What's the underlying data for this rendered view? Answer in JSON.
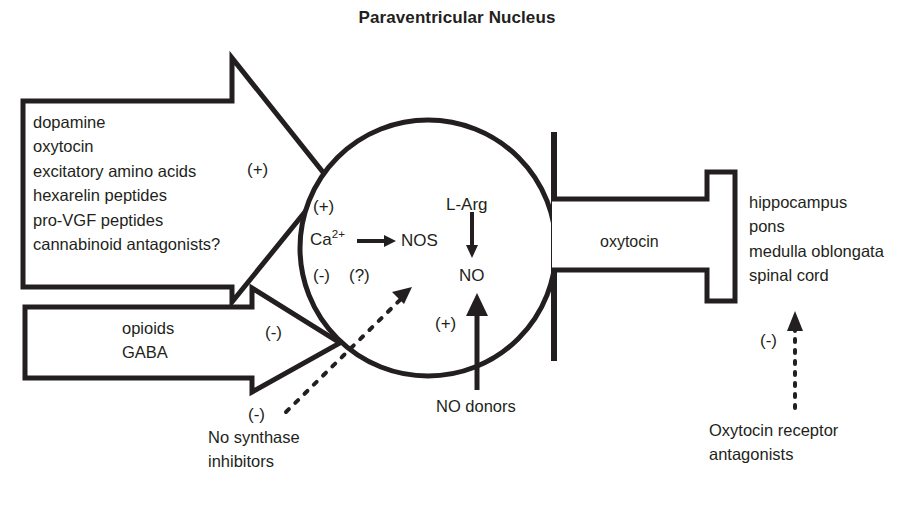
{
  "title": "Paraventricular Nucleus",
  "inputs": {
    "label": "excitatory-inputs",
    "sign": "(+)",
    "items_text": "dopamine\noxytocin\nexcitatory amino acids\nhexarelin peptides\npro-VGF peptides\ncannabinoid antagonists?",
    "items": [
      "dopamine",
      "oxytocin",
      "excitatory amino acids",
      "hexarelin peptides",
      "pro-VGF peptides",
      "cannabinoid antagonists?"
    ]
  },
  "inhibitors": {
    "sign": "(-)",
    "items_text": "opioids\nGABA",
    "items": [
      "opioids",
      "GABA"
    ]
  },
  "nucleus": {
    "sign_excitatory": "(+)",
    "sign_inhibitory": "(-)",
    "sign_unknown": "(?)",
    "calcium": "Ca",
    "calcium_charge": "2+",
    "enzyme": "NOS",
    "substrate": "L-Arg",
    "product": "NO"
  },
  "no_donors": {
    "sign": "(+)",
    "label": "NO donors"
  },
  "no_synthase_inhibitors": {
    "sign": "(-)",
    "label_text": "No synthase\ninhibitors",
    "lines": [
      "No synthase",
      "inhibitors"
    ]
  },
  "output": {
    "label": "oxytocin",
    "targets_text": "hippocampus\npons\nmedulla oblongata\nspinal cord",
    "targets": [
      "hippocampus",
      "pons",
      "medulla oblongata",
      "spinal cord"
    ]
  },
  "oxytocin_receptor_antagonists": {
    "sign": "(-)",
    "label_text": "Oxytocin receptor\nantagonists",
    "lines": [
      "Oxytocin receptor",
      "antagonists"
    ]
  },
  "colors": {
    "ink": "#231f20",
    "background": "#ffffff"
  }
}
